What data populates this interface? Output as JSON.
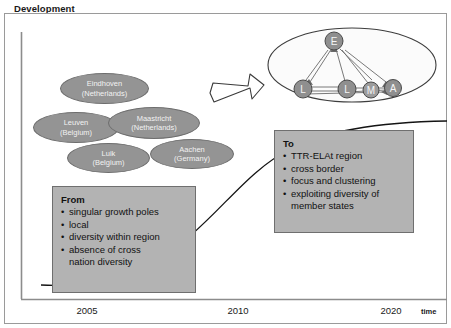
{
  "slide": {
    "title": "Development",
    "background_color": "#ffffff",
    "frame_border_color": "#9a9a9a"
  },
  "axis": {
    "name": "time",
    "ticks": [
      "2005",
      "2010",
      "2020"
    ],
    "line_color": "#8c8c8c"
  },
  "cities": [
    {
      "name": "Eindhoven",
      "country": "(Netherlands)",
      "node_letter": "E"
    },
    {
      "name": "Leuven",
      "country": "(Belgium)",
      "node_letter": "L"
    },
    {
      "name": "Maastricht",
      "country": "(Netherlands)",
      "node_letter": "M"
    },
    {
      "name": "Luik",
      "country": "(Belgium)",
      "node_letter": "L"
    },
    {
      "name": "Aachen",
      "country": "(Germany)",
      "node_letter": "A"
    }
  ],
  "network": {
    "nodes": [
      {
        "label": "E"
      },
      {
        "label": "L"
      },
      {
        "label": "L"
      },
      {
        "label": "M"
      },
      {
        "label": "A"
      }
    ],
    "node_color": "#8f8f8f",
    "ellipse_fill": "#fbfbfb"
  },
  "from_box": {
    "heading": "From",
    "items": [
      "singular growth poles",
      "local",
      "diversity within region",
      "absence of cross\n nation diversity"
    ],
    "fill_color": "#b3b3b3"
  },
  "to_box": {
    "heading": "To",
    "items": [
      "TTR-ELAt region",
      "cross border",
      "focus and clustering",
      "exploiting diversity of\n member states"
    ],
    "fill_color": "#b3b3b3"
  },
  "transition_arrow": {
    "icon": "block-arrow-up-right-icon",
    "fill_color": "#ffffff",
    "stroke_color": "#333333"
  },
  "trend_curve": {
    "stroke_color": "#111111"
  }
}
